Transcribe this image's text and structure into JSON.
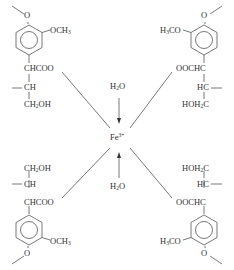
{
  "diagram": {
    "title": "",
    "center": {
      "metal": "Fe",
      "charge": "3+"
    },
    "water_ligands": [
      {
        "position": "top",
        "formula_parts": [
          "H",
          "2",
          "O"
        ]
      },
      {
        "position": "bottom",
        "formula_parts": [
          "H",
          "2",
          "O"
        ]
      }
    ],
    "ligands": [
      {
        "position": "top-left",
        "ring_substituent_methoxy": {
          "parts": [
            "OCH",
            "3"
          ]
        },
        "ring_oxygen": "O",
        "carboxylate": "CHCOO",
        "methine": "CH",
        "terminal": {
          "parts": [
            "CH",
            "2",
            "OH"
          ]
        }
      },
      {
        "position": "top-right",
        "ring_substituent_methoxy": {
          "parts": [
            "H",
            "3",
            "CO"
          ]
        },
        "ring_oxygen": "O",
        "carboxylate": "OOCHC",
        "methine": "HC",
        "terminal": {
          "parts": [
            "HOH",
            "2",
            "C"
          ]
        }
      },
      {
        "position": "bottom-left",
        "ring_substituent_methoxy": {
          "parts": [
            "OCH",
            "3"
          ]
        },
        "ring_oxygen": "O",
        "carboxylate": "CHCOO",
        "methine": "CH",
        "terminal": {
          "parts": [
            "CH",
            "2",
            "OH"
          ]
        }
      },
      {
        "position": "bottom-right",
        "ring_substituent_methoxy": {
          "parts": [
            "H",
            "3",
            "CO"
          ]
        },
        "ring_oxygen": "O",
        "carboxylate": "OOCHC",
        "methine": "HC",
        "terminal": {
          "parts": [
            "HOH",
            "2",
            "C"
          ]
        }
      }
    ],
    "colors": {
      "text": "#333333",
      "bonds": "#555555",
      "background": "#ffffff"
    }
  }
}
